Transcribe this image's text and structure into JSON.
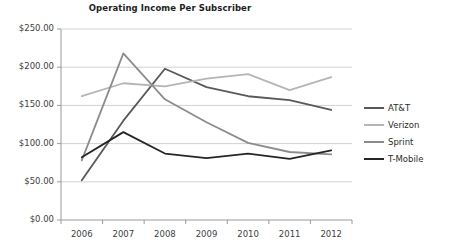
{
  "chart_data": {
    "type": "line",
    "title": "Operating Income Per Subscriber",
    "xlabel": "",
    "ylabel": "",
    "categories": [
      "2006",
      "2007",
      "2008",
      "2009",
      "2010",
      "2011",
      "2012"
    ],
    "x": [
      2006,
      2007,
      2008,
      2009,
      2010,
      2011,
      2012
    ],
    "ylim": [
      0,
      250
    ],
    "ytick_values": [
      0,
      50,
      100,
      150,
      200,
      250
    ],
    "ytick_labels": [
      "$0.00",
      "$50.00",
      "$100.00",
      "$150.00",
      "$200.00",
      "$250.00"
    ],
    "grid": true,
    "legend_position": "right",
    "series": [
      {
        "name": "AT&T",
        "color": "#595959",
        "values": [
          52,
          130,
          198,
          174,
          162,
          157,
          144
        ]
      },
      {
        "name": "Verizon",
        "color": "#b5b5b5",
        "values": [
          162,
          179,
          175,
          185,
          191,
          170,
          187
        ]
      },
      {
        "name": "Sprint",
        "color": "#8c8c8c",
        "values": [
          78,
          218,
          158,
          128,
          101,
          89,
          86
        ]
      },
      {
        "name": "T-Mobile",
        "color": "#262626",
        "values": [
          82,
          115,
          87,
          81,
          87,
          80,
          91
        ]
      }
    ]
  },
  "legend": {
    "items": [
      {
        "label": "AT&T"
      },
      {
        "label": "Verizon"
      },
      {
        "label": "Sprint"
      },
      {
        "label": "T-Mobile"
      }
    ]
  },
  "axis": {
    "y_labels": [
      "$250.00",
      "$200.00",
      "$150.00",
      "$100.00",
      "$50.00",
      "$0.00"
    ],
    "x_labels": [
      "2006",
      "2007",
      "2008",
      "2009",
      "2010",
      "2011",
      "2012"
    ]
  }
}
